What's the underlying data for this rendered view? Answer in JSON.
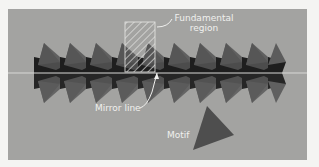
{
  "figure": {
    "background_color": "#a3a3a1",
    "motif_color": "#5a5a5a",
    "dark_band_color": "#1e1e1e",
    "mirror_line_color": "#d8d8d6"
  },
  "labels": {
    "fundamental_region_line1": "Fundamental",
    "fundamental_region_line2": "region",
    "mirror_line": "Mirror line",
    "motif": "Motif"
  },
  "pattern": {
    "repeat_count": 10,
    "period_px": 26,
    "mirror_line_y": 73
  }
}
